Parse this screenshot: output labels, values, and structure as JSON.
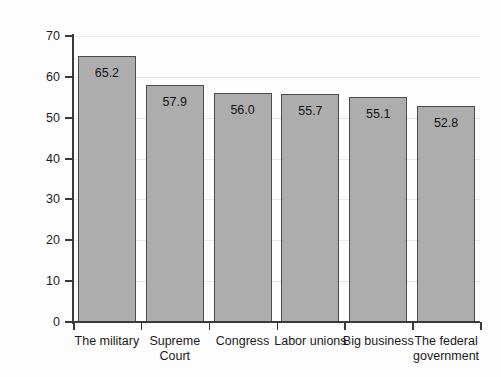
{
  "chart_data": {
    "type": "bar",
    "title": "",
    "xlabel": "",
    "ylabel": "Percent",
    "ylim": [
      0,
      70
    ],
    "ytick_step": 10,
    "yticks": [
      70,
      60,
      50,
      40,
      30,
      20,
      10,
      0
    ],
    "grid": true,
    "grid_axis": "y",
    "legend": false,
    "categories": [
      "The military",
      "Supreme Court",
      "Congress",
      "Labor unions",
      "Big business",
      "The federal government"
    ],
    "category_lines": [
      [
        "The military"
      ],
      [
        "Supreme",
        "Court"
      ],
      [
        "Congress"
      ],
      [
        "Labor unions"
      ],
      [
        "Big business"
      ],
      [
        "The federal",
        "government"
      ]
    ],
    "values": [
      65.2,
      57.9,
      56.0,
      55.7,
      55.1,
      52.8
    ],
    "value_labels": [
      "65.2",
      "57.9",
      "56.0",
      "55.7",
      "55.1",
      "52.8"
    ],
    "colors": {
      "bar_fill": "#adadad",
      "bar_edge": "#4b4b4b",
      "gridline": "#e8e8e8",
      "axis": "#3a3a3a",
      "text": "#1a1a1a",
      "background": "#fdfdfd"
    }
  }
}
